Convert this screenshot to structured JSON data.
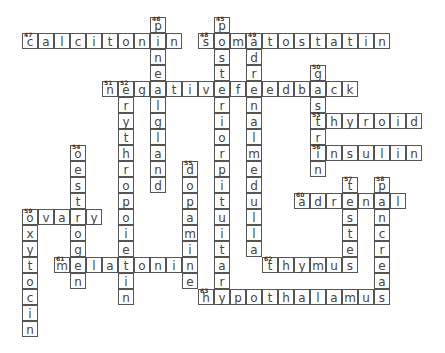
{
  "grid": {
    "origin_x": 22,
    "origin_y": 17,
    "cell": 16,
    "border_color": "#555555",
    "letter_color": "#444444"
  },
  "words": [
    {
      "num": "47",
      "answer": "calcitonin",
      "dir": "across",
      "row": 1,
      "col": 0
    },
    {
      "num": "46",
      "answer": "pinealgland",
      "dir": "down",
      "row": 0,
      "col": 8
    },
    {
      "num": "48",
      "answer": "somatostatin",
      "dir": "across",
      "row": 1,
      "col": 11
    },
    {
      "num": "45",
      "answer": "posteriorpituitary",
      "dir": "down",
      "row": 0,
      "col": 12
    },
    {
      "num": "49",
      "answer": "adrenalmedulla",
      "dir": "down",
      "row": 1,
      "col": 14
    },
    {
      "num": "50",
      "answer": "gastrin",
      "dir": "down",
      "row": 3,
      "col": 18
    },
    {
      "num": "51",
      "answer": "negativefeedback",
      "dir": "across",
      "row": 4,
      "col": 5
    },
    {
      "num": "52",
      "answer": "erythropoietin",
      "dir": "down",
      "row": 4,
      "col": 6
    },
    {
      "num": "53",
      "answer": "thyroid",
      "dir": "across",
      "row": 6,
      "col": 18
    },
    {
      "num": "56",
      "answer": "insulin",
      "dir": "across",
      "row": 8,
      "col": 18
    },
    {
      "num": "54",
      "answer": "oestrogen",
      "dir": "down",
      "row": 8,
      "col": 3
    },
    {
      "num": "55",
      "answer": "dopamine",
      "dir": "down",
      "row": 9,
      "col": 10
    },
    {
      "num": "57",
      "answer": "testes",
      "dir": "down",
      "row": 10,
      "col": 20
    },
    {
      "num": "58",
      "answer": "pancreas",
      "dir": "down",
      "row": 10,
      "col": 22
    },
    {
      "num": "60",
      "answer": "adrenal",
      "dir": "across",
      "row": 11,
      "col": 17
    },
    {
      "num": "59",
      "answer": "ovary",
      "dir": "across",
      "row": 12,
      "col": 0
    },
    {
      "num": "59",
      "answer": "oxytocin",
      "dir": "down",
      "row": 12,
      "col": 0
    },
    {
      "num": "61",
      "answer": "melatonin",
      "dir": "across",
      "row": 15,
      "col": 2
    },
    {
      "num": "62",
      "answer": "thymus",
      "dir": "across",
      "row": 15,
      "col": 15
    },
    {
      "num": "63",
      "answer": "hypothalamus",
      "dir": "across",
      "row": 17,
      "col": 11
    }
  ]
}
